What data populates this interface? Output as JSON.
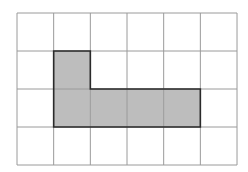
{
  "diagram": {
    "type": "grid-shape",
    "grid": {
      "columns": 6,
      "rows": 4,
      "origin_x": 17,
      "origin_y": 13,
      "cell_width": 36.67,
      "cell_height": 38,
      "line_color": "#9a9a9a",
      "background": "#ffffff"
    },
    "shape": {
      "fill_color": "#bdbdbd",
      "outline_color": "#2a2a2a",
      "cells": [
        {
          "row": 1,
          "col": 1
        },
        {
          "row": 2,
          "col": 1
        },
        {
          "row": 2,
          "col": 2
        },
        {
          "row": 2,
          "col": 3
        },
        {
          "row": 2,
          "col": 4
        }
      ],
      "outline_points": [
        [
          1,
          1
        ],
        [
          2,
          1
        ],
        [
          2,
          2
        ],
        [
          5,
          2
        ],
        [
          5,
          3
        ],
        [
          1,
          3
        ]
      ]
    }
  }
}
